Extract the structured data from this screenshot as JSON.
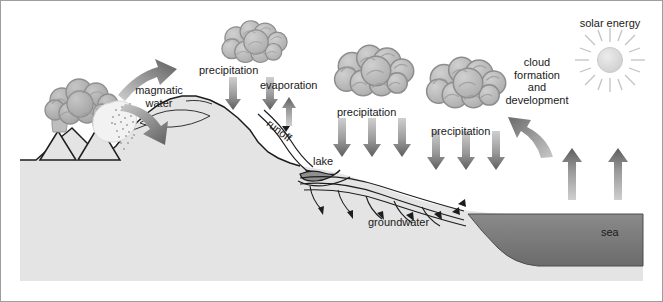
{
  "diagram": {
    "type": "hydrological-cycle-cross-section",
    "colors": {
      "background": "#ffffff",
      "border": "#9a9a9a",
      "ground_fill": "#e3e3e3",
      "ground_outline": "#1a1a1a",
      "sea_fill_top": "#808080",
      "sea_fill_bottom": "#6f6f6f",
      "cloud_fill": "#b8b8b8",
      "cloud_outline": "#8f8f8f",
      "arrow_dark": "#5f5f5f",
      "arrow_light": "#c9c9c9",
      "sun_fill": "#dcdcdc",
      "sun_ray": "#c0c0c0",
      "text": "#1a1a1a"
    }
  },
  "labels": {
    "magmatic_water_line1": "magmatic",
    "magmatic_water_line2": "water",
    "precipitation_1": "precipitation",
    "evaporation": "evaporation",
    "runoff": "runoff",
    "lake": "lake",
    "precipitation_2": "precipitation",
    "precipitation_3": "precipitation",
    "cloud_formation_line1": "cloud",
    "cloud_formation_line2": "formation",
    "cloud_formation_line3": "and",
    "cloud_formation_line4": "development",
    "solar_energy": "solar  energy",
    "groundwater": "groundwater",
    "sea": "sea"
  },
  "features": {
    "volcanoes": {
      "count": 2,
      "name": "volcanic-eruption"
    },
    "clouds": {
      "count": 3
    },
    "sun": {
      "rays": 16
    },
    "precipitation_arrow_groups": [
      {
        "name": "precipitation-arrows-1",
        "count": 2
      },
      {
        "name": "precipitation-arrows-2",
        "count": 3
      },
      {
        "name": "precipitation-arrows-3",
        "count": 3
      }
    ],
    "evaporation_arrows": {
      "land": 1,
      "sea": 2
    },
    "groundwater_flow_arrows": {
      "count": 5
    },
    "magmatic_arrows": {
      "count": 2
    }
  }
}
